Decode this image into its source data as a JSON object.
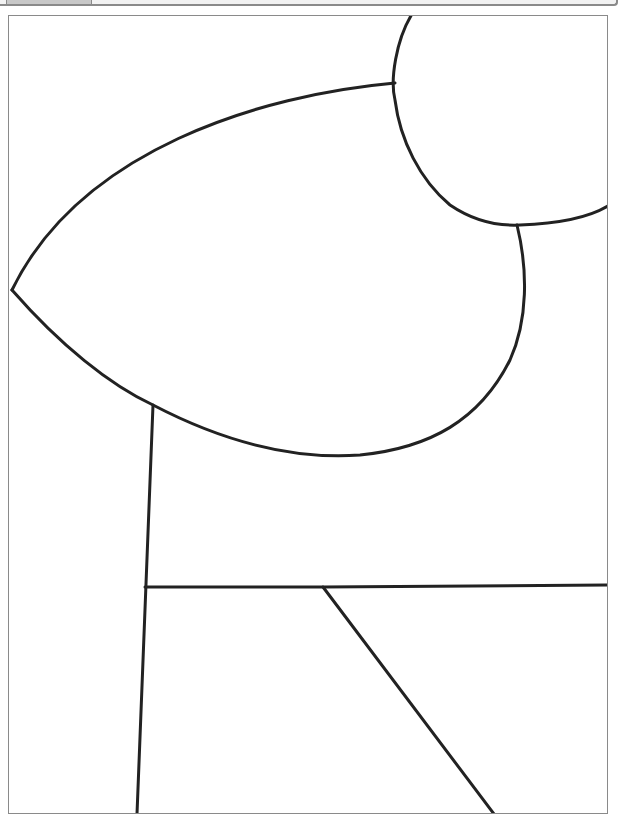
{
  "viewer": {
    "top_tab": "",
    "frame_border_color": "#8a8a8a"
  },
  "drawing": {
    "type": "line-art coloring page",
    "stroke_color": "#222222",
    "background": "#ffffff",
    "shapes": [
      {
        "name": "circle-top-right",
        "description": "partial circle clipped at top and right edge"
      },
      {
        "name": "leaf-shape",
        "description": "large pointed leaf/lens shape pointing left"
      },
      {
        "name": "vertical-line",
        "description": "slanted vertical line from leaf bottom down to frame bottom"
      },
      {
        "name": "horizontal-line",
        "description": "horizontal line across lower area"
      },
      {
        "name": "diagonal-line",
        "description": "diagonal line from horizontal line down to bottom"
      }
    ]
  }
}
